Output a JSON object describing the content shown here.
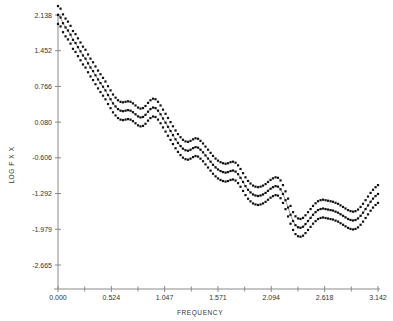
{
  "chart_data": {
    "type": "line",
    "title": "",
    "xlabel": "FREQUENCY",
    "ylabel": "LOG F X X",
    "xlim": [
      0.0,
      3.142
    ],
    "ylim": [
      -2.665,
      2.138
    ],
    "grid": false,
    "legend": "none",
    "x_ticks": [
      "0.000",
      "0.524",
      "1.047",
      "1.571",
      "2.094",
      "2.618",
      "3.142"
    ],
    "x_tick_values": [
      0.0,
      0.524,
      1.047,
      1.571,
      2.094,
      2.618,
      3.142
    ],
    "y_ticks": [
      "2.138",
      "1.452",
      "0.766",
      "0.080",
      "-0.606",
      "-1.292",
      "-1.979",
      "-2.665"
    ],
    "y_tick_values": [
      2.138,
      1.452,
      0.766,
      0.08,
      -0.606,
      -1.292,
      -1.979,
      -2.665
    ],
    "x": [
      0.0,
      0.025,
      0.049,
      0.074,
      0.098,
      0.123,
      0.147,
      0.172,
      0.196,
      0.221,
      0.245,
      0.27,
      0.295,
      0.319,
      0.344,
      0.368,
      0.393,
      0.417,
      0.442,
      0.466,
      0.491,
      0.516,
      0.54,
      0.565,
      0.589,
      0.614,
      0.638,
      0.663,
      0.687,
      0.712,
      0.736,
      0.761,
      0.786,
      0.81,
      0.835,
      0.859,
      0.884,
      0.908,
      0.933,
      0.957,
      0.982,
      1.007,
      1.031,
      1.056,
      1.08,
      1.105,
      1.129,
      1.154,
      1.178,
      1.203,
      1.227,
      1.252,
      1.277,
      1.301,
      1.326,
      1.35,
      1.375,
      1.399,
      1.424,
      1.448,
      1.473,
      1.498,
      1.522,
      1.547,
      1.571,
      1.596,
      1.62,
      1.645,
      1.669,
      1.694,
      1.718,
      1.743,
      1.768,
      1.792,
      1.817,
      1.841,
      1.866,
      1.89,
      1.915,
      1.939,
      1.964,
      1.989,
      2.013,
      2.038,
      2.062,
      2.087,
      2.111,
      2.136,
      2.16,
      2.185,
      2.209,
      2.234,
      2.259,
      2.283,
      2.308,
      2.332,
      2.357,
      2.381,
      2.406,
      2.43,
      2.455,
      2.48,
      2.504,
      2.529,
      2.553,
      2.578,
      2.602,
      2.627,
      2.651,
      2.676,
      2.7,
      2.725,
      2.75,
      2.774,
      2.799,
      2.823,
      2.848,
      2.872,
      2.897,
      2.921,
      2.946,
      2.971,
      2.995,
      3.02,
      3.044,
      3.069,
      3.093,
      3.118,
      3.142
    ],
    "series": [
      {
        "name": "log spectral density estimate",
        "role": "center",
        "values": [
          2.138,
          2.09,
          1.98,
          1.9,
          1.84,
          1.76,
          1.66,
          1.6,
          1.52,
          1.44,
          1.36,
          1.3,
          1.21,
          1.13,
          1.06,
          0.98,
          0.9,
          0.83,
          0.76,
          0.69,
          0.6,
          0.52,
          0.44,
          0.38,
          0.33,
          0.3,
          0.29,
          0.3,
          0.31,
          0.3,
          0.27,
          0.23,
          0.19,
          0.17,
          0.18,
          0.22,
          0.28,
          0.33,
          0.36,
          0.35,
          0.3,
          0.23,
          0.15,
          0.07,
          -0.01,
          -0.09,
          -0.17,
          -0.25,
          -0.32,
          -0.38,
          -0.43,
          -0.46,
          -0.47,
          -0.45,
          -0.42,
          -0.4,
          -0.41,
          -0.45,
          -0.5,
          -0.56,
          -0.62,
          -0.68,
          -0.74,
          -0.79,
          -0.83,
          -0.86,
          -0.88,
          -0.89,
          -0.88,
          -0.86,
          -0.85,
          -0.87,
          -0.92,
          -0.99,
          -1.07,
          -1.15,
          -1.22,
          -1.27,
          -1.31,
          -1.33,
          -1.34,
          -1.33,
          -1.31,
          -1.28,
          -1.24,
          -1.2,
          -1.17,
          -1.15,
          -1.16,
          -1.21,
          -1.3,
          -1.42,
          -1.56,
          -1.7,
          -1.82,
          -1.9,
          -1.94,
          -1.95,
          -1.93,
          -1.88,
          -1.82,
          -1.76,
          -1.7,
          -1.65,
          -1.61,
          -1.59,
          -1.58,
          -1.59,
          -1.6,
          -1.61,
          -1.62,
          -1.64,
          -1.66,
          -1.69,
          -1.72,
          -1.75,
          -1.78,
          -1.8,
          -1.81,
          -1.8,
          -1.77,
          -1.72,
          -1.66,
          -1.59,
          -1.52,
          -1.45,
          -1.39,
          -1.34,
          -1.3
        ]
      },
      {
        "name": "upper confidence band",
        "role": "upper",
        "values": [
          2.31,
          2.26,
          2.15,
          2.07,
          2.01,
          1.93,
          1.83,
          1.77,
          1.69,
          1.61,
          1.53,
          1.47,
          1.38,
          1.3,
          1.23,
          1.15,
          1.07,
          1.0,
          0.93,
          0.86,
          0.77,
          0.69,
          0.61,
          0.55,
          0.5,
          0.47,
          0.46,
          0.47,
          0.48,
          0.47,
          0.44,
          0.4,
          0.36,
          0.34,
          0.35,
          0.39,
          0.45,
          0.5,
          0.53,
          0.52,
          0.47,
          0.4,
          0.32,
          0.24,
          0.16,
          0.08,
          0.0,
          -0.08,
          -0.15,
          -0.21,
          -0.26,
          -0.29,
          -0.3,
          -0.28,
          -0.25,
          -0.23,
          -0.24,
          -0.28,
          -0.33,
          -0.39,
          -0.45,
          -0.51,
          -0.57,
          -0.62,
          -0.66,
          -0.69,
          -0.71,
          -0.72,
          -0.71,
          -0.69,
          -0.68,
          -0.7,
          -0.75,
          -0.82,
          -0.9,
          -0.98,
          -1.05,
          -1.1,
          -1.14,
          -1.16,
          -1.17,
          -1.16,
          -1.14,
          -1.11,
          -1.07,
          -1.03,
          -1.0,
          -0.98,
          -0.99,
          -1.04,
          -1.13,
          -1.25,
          -1.39,
          -1.53,
          -1.65,
          -1.73,
          -1.77,
          -1.78,
          -1.76,
          -1.71,
          -1.65,
          -1.59,
          -1.53,
          -1.48,
          -1.44,
          -1.42,
          -1.41,
          -1.42,
          -1.43,
          -1.44,
          -1.45,
          -1.47,
          -1.49,
          -1.52,
          -1.55,
          -1.58,
          -1.61,
          -1.63,
          -1.64,
          -1.63,
          -1.6,
          -1.55,
          -1.49,
          -1.42,
          -1.35,
          -1.28,
          -1.22,
          -1.17,
          -1.13
        ]
      },
      {
        "name": "lower confidence band",
        "role": "lower",
        "values": [
          1.966,
          1.918,
          1.808,
          1.728,
          1.668,
          1.588,
          1.488,
          1.428,
          1.348,
          1.268,
          1.188,
          1.128,
          1.038,
          0.958,
          0.888,
          0.808,
          0.728,
          0.658,
          0.588,
          0.518,
          0.428,
          0.348,
          0.268,
          0.208,
          0.158,
          0.128,
          0.118,
          0.128,
          0.138,
          0.128,
          0.098,
          0.058,
          0.018,
          -0.002,
          0.008,
          0.048,
          0.108,
          0.158,
          0.188,
          0.178,
          0.128,
          0.058,
          -0.022,
          -0.102,
          -0.182,
          -0.262,
          -0.342,
          -0.422,
          -0.492,
          -0.552,
          -0.602,
          -0.632,
          -0.642,
          -0.622,
          -0.592,
          -0.572,
          -0.582,
          -0.622,
          -0.672,
          -0.732,
          -0.792,
          -0.852,
          -0.912,
          -0.962,
          -1.002,
          -1.032,
          -1.052,
          -1.062,
          -1.052,
          -1.032,
          -1.022,
          -1.042,
          -1.092,
          -1.162,
          -1.242,
          -1.322,
          -1.392,
          -1.442,
          -1.482,
          -1.502,
          -1.512,
          -1.502,
          -1.482,
          -1.452,
          -1.412,
          -1.372,
          -1.342,
          -1.322,
          -1.332,
          -1.382,
          -1.472,
          -1.592,
          -1.732,
          -1.872,
          -1.992,
          -2.072,
          -2.112,
          -2.122,
          -2.102,
          -2.052,
          -1.992,
          -1.932,
          -1.872,
          -1.822,
          -1.782,
          -1.762,
          -1.752,
          -1.762,
          -1.772,
          -1.782,
          -1.792,
          -1.812,
          -1.832,
          -1.862,
          -1.892,
          -1.922,
          -1.952,
          -1.972,
          -1.982,
          -1.972,
          -1.942,
          -1.892,
          -1.832,
          -1.762,
          -1.692,
          -1.622,
          -1.562,
          -1.512,
          -1.472
        ]
      }
    ]
  },
  "colors": {
    "marker": "#111111",
    "line": "#6f6f6f",
    "axis": "#8a8a8a",
    "text": "#333333",
    "background": "#ffffff"
  }
}
